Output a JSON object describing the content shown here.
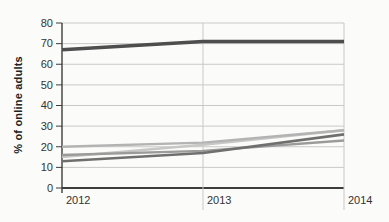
{
  "chart_data": {
    "type": "line",
    "title": "",
    "xlabel": "",
    "ylabel": "% of online adults",
    "x": [
      "2012",
      "2013",
      "2014"
    ],
    "ylim": [
      0,
      80
    ],
    "ytick_step": 10,
    "grid": true,
    "legend_position": "none",
    "series": [
      {
        "name": "line-lightest-gray",
        "values": [
          15,
          21,
          28
        ],
        "color": "#c7c7c7",
        "width": 2.4
      },
      {
        "name": "line-light-gray",
        "values": [
          20,
          22,
          28
        ],
        "color": "#b3b3b3",
        "width": 2.4
      },
      {
        "name": "line-medium-gray",
        "values": [
          16,
          18,
          23
        ],
        "color": "#9b9b9b",
        "width": 2.4
      },
      {
        "name": "line-dark-medium",
        "values": [
          13,
          17,
          26
        ],
        "color": "#6f6f6f",
        "width": 2.6
      },
      {
        "name": "line-dark-thick",
        "values": [
          67,
          71,
          71
        ],
        "color": "#4e4e4e",
        "width": 3.6
      }
    ],
    "colors": {
      "background": "#fbfbf9",
      "grid": "#c9c9c9",
      "axis": "#3d3d3d",
      "tick_label": "#333333"
    }
  }
}
